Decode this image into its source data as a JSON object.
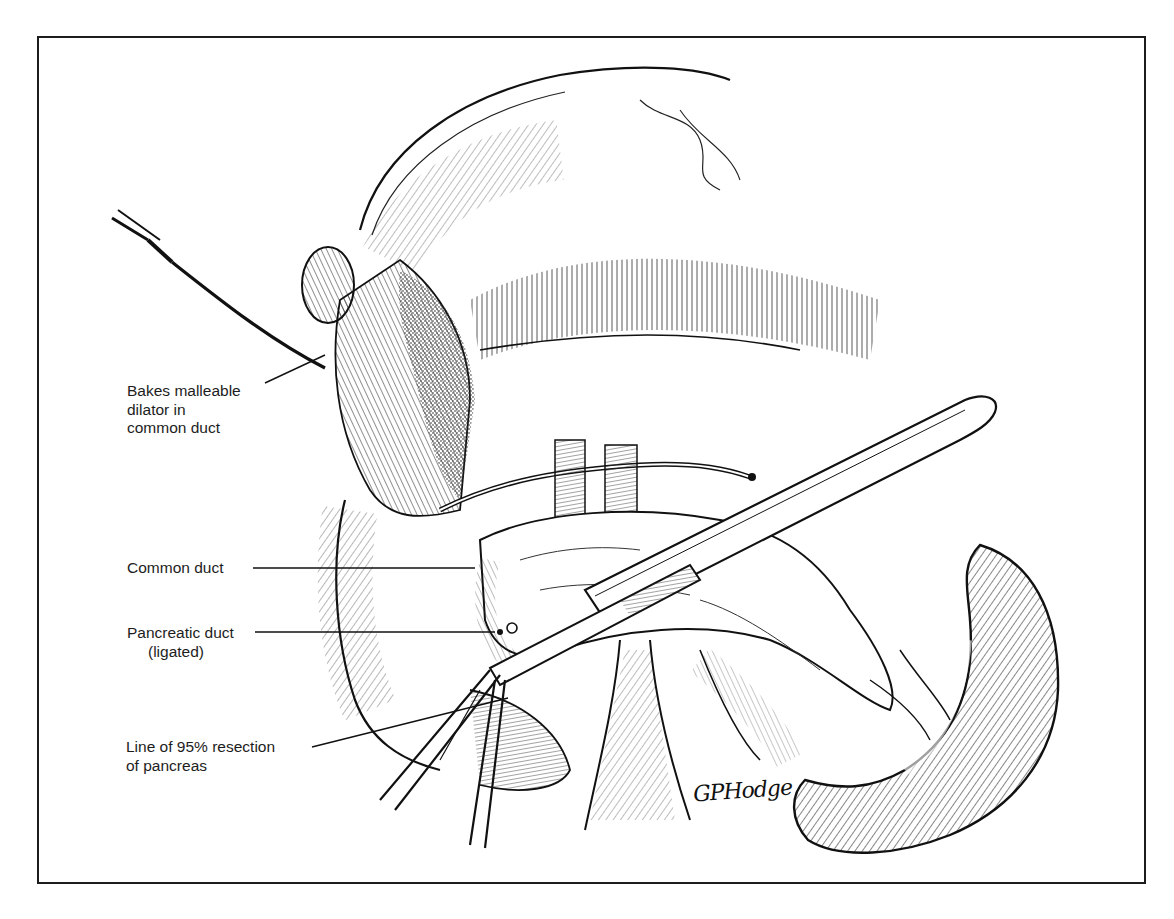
{
  "figure": {
    "type": "surgical-illustration",
    "style": "black-and-white pen-and-ink line drawing",
    "frame_color": "#1c1c1c",
    "ink_color": "#111111",
    "background_color": "#ffffff"
  },
  "labels": [
    {
      "id": "dilator",
      "lines": [
        "Bakes malleable",
        "dilator in",
        "common duct"
      ]
    },
    {
      "id": "common-duct",
      "lines": [
        "Common duct"
      ]
    },
    {
      "id": "pancreatic-duct",
      "lines": [
        "Pancreatic duct",
        "(ligated)"
      ]
    },
    {
      "id": "resection-line",
      "lines": [
        "Line of 95% resection",
        "of pancreas"
      ]
    }
  ],
  "signature": "GPHodge",
  "depicted_structures": [
    "Bakes malleable dilator",
    "liver / gallbladder region",
    "common duct",
    "pancreatic duct (ligated)",
    "pancreas",
    "retractor blade",
    "scalpel handle",
    "duodenum",
    "spleen",
    "clamps",
    "mesenteric vessels"
  ]
}
